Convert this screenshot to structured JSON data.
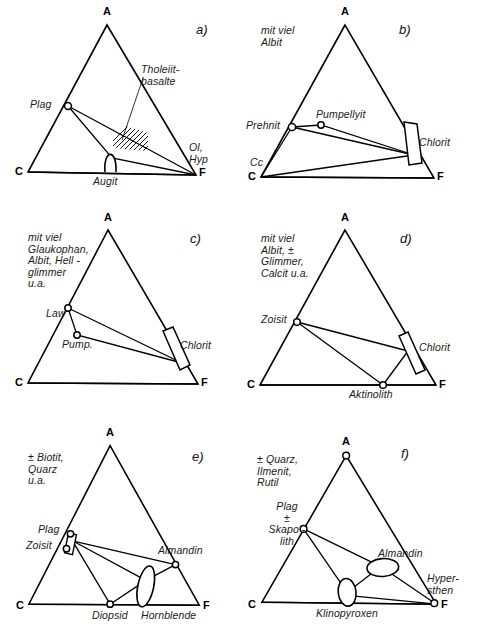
{
  "figure": {
    "type": "acf-ternary-diagram-set",
    "panel_count": 6,
    "vertex_labels": {
      "a_label": "A",
      "c_label": "C",
      "f_label": "F"
    },
    "line_color": "#000000",
    "node_fill": "#ffffff"
  },
  "panels": [
    {
      "id": "a",
      "id_label": "a)",
      "note": "",
      "vertices": {
        "A": "A",
        "C": "C",
        "F": "F"
      },
      "minerals": [
        {
          "name": "Plag",
          "label": "Plag"
        },
        {
          "name": "Augit",
          "label": "Augit"
        }
      ],
      "annotations": [
        {
          "name": "tholeiit-basalte",
          "label": "Tholeiit-\nbasalte"
        },
        {
          "name": "ol-hyp",
          "label": "Ol,\nHyp"
        }
      ]
    },
    {
      "id": "b",
      "id_label": "b)",
      "note": "mit viel\nAlbit",
      "vertices": {
        "A": "A",
        "C": "C",
        "F": "F"
      },
      "minerals": [
        {
          "name": "Prehnit",
          "label": "Prehnit"
        },
        {
          "name": "Pumpellyit",
          "label": "Pumpellyit"
        },
        {
          "name": "Chlorit",
          "label": "Chlorit"
        },
        {
          "name": "Cc",
          "label": "Cc"
        }
      ],
      "annotations": []
    },
    {
      "id": "c",
      "id_label": "c)",
      "note": "mit viel\nGlaukophan,\nAlbit, Hell -\nglimmer\nu.a.",
      "vertices": {
        "A": "A",
        "C": "C",
        "F": "F"
      },
      "minerals": [
        {
          "name": "Law",
          "label": "Law"
        },
        {
          "name": "Pump",
          "label": "Pump."
        },
        {
          "name": "Chlorit",
          "label": "Chlorit"
        }
      ],
      "annotations": []
    },
    {
      "id": "d",
      "id_label": "d)",
      "note": "mit viel\nAlbit, ±\nGlimmer,\nCalcit u.a.",
      "vertices": {
        "A": "A",
        "C": "C",
        "F": "F"
      },
      "minerals": [
        {
          "name": "Zoisit",
          "label": "Zoisit"
        },
        {
          "name": "Chlorit",
          "label": "Chlorit"
        },
        {
          "name": "Aktinolith",
          "label": "Aktinolith"
        }
      ],
      "annotations": []
    },
    {
      "id": "e",
      "id_label": "e)",
      "note": "± Biotit,\nQuarz\nu.a.",
      "vertices": {
        "A": "A",
        "C": "C",
        "F": "F"
      },
      "minerals": [
        {
          "name": "Plag",
          "label": "Plag"
        },
        {
          "name": "Zoisit",
          "label": "Zoisit"
        },
        {
          "name": "Almandin",
          "label": "Almandin"
        },
        {
          "name": "Diopsid",
          "label": "Diopsid"
        },
        {
          "name": "Hornblende",
          "label": "Hornblende"
        }
      ],
      "annotations": []
    },
    {
      "id": "f",
      "id_label": "f)",
      "note": "± Quarz,\nIlmenit,\nRutil",
      "vertices": {
        "A": "A",
        "C": "C",
        "F": "F"
      },
      "minerals": [
        {
          "name": "Plag-Skapolith",
          "label": "Plag\n±\nSkapo -\nlith"
        },
        {
          "name": "Almandin",
          "label": "Almandin"
        },
        {
          "name": "Hypersthen",
          "label": "Hyper-\nsthen"
        },
        {
          "name": "Klinopyroxen",
          "label": "Klinopyroxen"
        }
      ],
      "annotations": []
    }
  ],
  "footer": {
    "clipped_caption": ""
  }
}
